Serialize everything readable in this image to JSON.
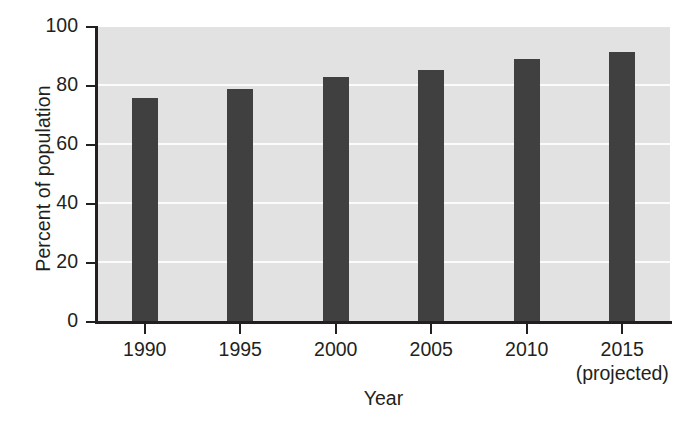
{
  "chart_data": {
    "type": "bar",
    "title": "",
    "xlabel": "Year",
    "ylabel": "Percent of population",
    "categories": [
      "1990",
      "1995",
      "2000",
      "2005",
      "2010",
      "2015"
    ],
    "category_sublabels": [
      "",
      "",
      "",
      "",
      "",
      "(projected)"
    ],
    "values": [
      76,
      79,
      83,
      85.5,
      89,
      91.5
    ],
    "ylim": [
      0,
      100
    ],
    "yticks": [
      0,
      20,
      40,
      60,
      80,
      100
    ],
    "ytick_labels": [
      "0",
      "20",
      "40",
      "60",
      "80",
      "100"
    ],
    "grid": true,
    "grid_axis": "y",
    "legend": null,
    "colors": {
      "bar": "#404040",
      "plot_background": "#e2e2e2",
      "gridline": "#fbfbfb",
      "axis": "#231f20",
      "page_background": "#ffffff",
      "text": "#231f20"
    }
  }
}
